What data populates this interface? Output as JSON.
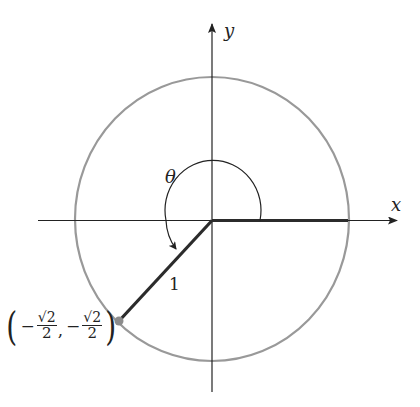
{
  "diagram": {
    "axes": {
      "x_label": "x",
      "y_label": "y"
    },
    "angle_label": "θ",
    "radius_label": "1",
    "point": {
      "x_sign": "−",
      "x_num": "√2",
      "x_den": "2",
      "comma": ",",
      "y_sign": "−",
      "y_num": "√2",
      "y_den": "2",
      "open_paren": "(",
      "close_paren": ")"
    },
    "colors": {
      "circle": "#999999",
      "axes": "#222222",
      "terminal_side": "#2b2b2b",
      "point": "#8c8c8c"
    }
  }
}
